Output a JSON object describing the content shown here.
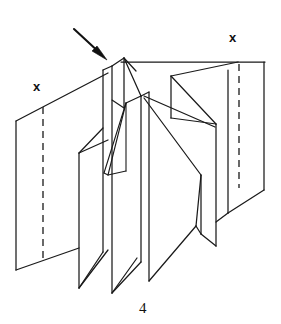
{
  "figure": {
    "caption": "4",
    "caption_position": {
      "x": 139,
      "y": 301
    },
    "background_color": "#ffffff",
    "line_color": "#1a1a1a",
    "marks": [
      {
        "label": "x",
        "name": "fold-mark-left",
        "x": 37,
        "y": 86,
        "dashed_line": {
          "x1": 43,
          "y1": 101,
          "x2": 43,
          "y2": 255
        }
      },
      {
        "label": "x",
        "name": "fold-mark-right",
        "x": 233,
        "y": 37,
        "dashed_line": {
          "x1": 239,
          "y1": 61,
          "x2": 239,
          "y2": 188
        }
      }
    ],
    "arrow": {
      "name": "direction-arrow",
      "from": {
        "x": 74,
        "y": 29
      },
      "to": {
        "x": 105,
        "y": 58
      },
      "points": "down-right"
    },
    "panels": [
      {
        "name": "panel-far-left",
        "outline": "16,121 108,73 108,216 16,270"
      },
      {
        "name": "panel-left-inner",
        "outline": "79,156 116,139 116,288 79,248"
      },
      {
        "name": "panel-left-center",
        "outline": "102,70 130,64 130,293 102,252"
      },
      {
        "name": "panel-center-hub",
        "outline": "143,98 175,90 175,280 143,262"
      },
      {
        "name": "panel-right-inner",
        "outline": "196,80 222,86 222,248 196,226"
      },
      {
        "name": "panel-far-right",
        "outline": "239,61 264,61 264,188 239,188"
      }
    ]
  }
}
